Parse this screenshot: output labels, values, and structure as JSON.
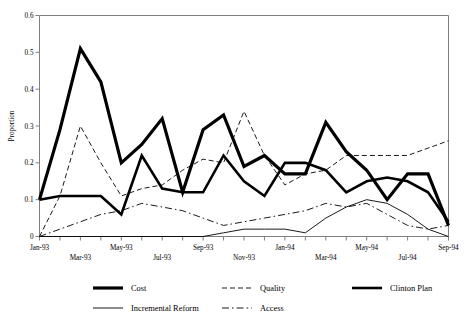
{
  "chart_data": {
    "type": "line",
    "title": "",
    "xlabel": "",
    "ylabel": "Proportion",
    "ylim": [
      0,
      0.6
    ],
    "yticks": [
      "0",
      "0.1",
      "0.2",
      "0.3",
      "0.4",
      "0.5",
      "0.6"
    ],
    "grid": false,
    "legend_position": "bottom",
    "x": [
      "Jan-93",
      "Feb-93",
      "Mar-93",
      "Apr-93",
      "May-93",
      "Jun-93",
      "Jul-93",
      "Aug-93",
      "Sep-93",
      "Oct-93",
      "Nov-93",
      "Dec-93",
      "Jan-94",
      "Feb-94",
      "Mar-94",
      "Apr-94",
      "May-94",
      "Jun-94",
      "Jul-94",
      "Aug-94",
      "Sep-94"
    ],
    "xtick_labels_row1": [
      "Jan-93",
      "May-93",
      "Sep-93",
      "Jan-94",
      "May-94",
      "Sep-94"
    ],
    "xtick_labels_row2": [
      "Mar-93",
      "Jul-93",
      "Nov-93",
      "Mar-94",
      "Jul-94"
    ],
    "series": [
      {
        "name": "Cost",
        "style": "solid-thick",
        "values": [
          0.1,
          0.29,
          0.51,
          0.42,
          0.2,
          0.25,
          0.32,
          0.12,
          0.29,
          0.33,
          0.19,
          0.22,
          0.17,
          0.17,
          0.31,
          0.23,
          0.18,
          0.1,
          0.17,
          0.17,
          0.03
        ]
      },
      {
        "name": "Quality",
        "style": "dashed",
        "values": [
          0.0,
          0.11,
          0.3,
          0.2,
          0.11,
          0.13,
          0.14,
          0.18,
          0.21,
          0.2,
          0.34,
          0.22,
          0.14,
          0.17,
          0.18,
          0.22,
          0.22,
          0.22,
          0.22,
          0.24,
          0.26
        ]
      },
      {
        "name": "Clinton Plan",
        "style": "solid-medium",
        "values": [
          0.1,
          0.11,
          0.11,
          0.11,
          0.06,
          0.22,
          0.13,
          0.12,
          0.12,
          0.22,
          0.15,
          0.11,
          0.2,
          0.2,
          0.18,
          0.12,
          0.15,
          0.16,
          0.15,
          0.12,
          0.04
        ]
      },
      {
        "name": "Incremental Reform",
        "style": "solid-thin",
        "values": [
          0.0,
          0.0,
          0.0,
          0.0,
          0.0,
          0.0,
          0.0,
          0.0,
          0.0,
          0.01,
          0.02,
          0.02,
          0.02,
          0.01,
          0.05,
          0.08,
          0.1,
          0.09,
          0.06,
          0.02,
          0.0
        ]
      },
      {
        "name": "Access",
        "style": "dash-dot",
        "values": [
          0.0,
          0.02,
          0.04,
          0.06,
          0.07,
          0.09,
          0.08,
          0.07,
          0.05,
          0.03,
          0.04,
          0.05,
          0.06,
          0.07,
          0.09,
          0.08,
          0.09,
          0.06,
          0.03,
          0.02,
          0.03
        ]
      }
    ]
  },
  "legend": {
    "entries": [
      {
        "label": "Cost",
        "style": "solid-thick"
      },
      {
        "label": "Quality",
        "style": "dashed"
      },
      {
        "label": "Clinton Plan",
        "style": "solid-medium"
      },
      {
        "label": "Incremental Reform",
        "style": "solid-thin"
      },
      {
        "label": "Access",
        "style": "dash-dot"
      }
    ]
  }
}
